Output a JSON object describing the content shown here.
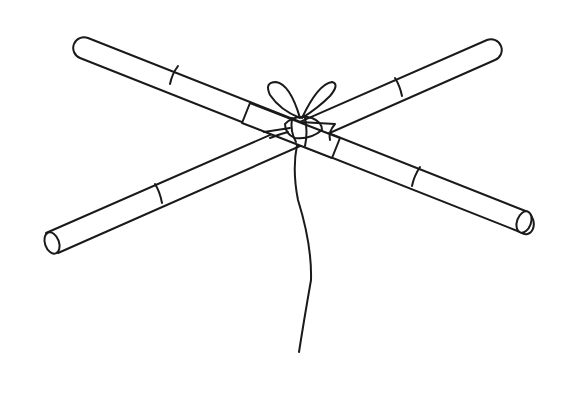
{
  "illustration": {
    "subject": "two crossed sticks tied with string",
    "colors": {
      "line": "#1a1a1a",
      "background": "#ffffff"
    }
  }
}
